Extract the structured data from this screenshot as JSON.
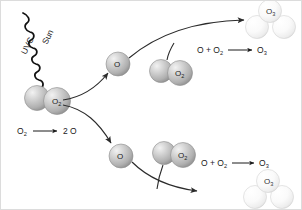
{
  "diagram": {
    "background_color": "#ffffff",
    "border_color": "#dcdcdc"
  },
  "radiation": {
    "source_label": "Sun",
    "type_label": "UVC",
    "icon": "wavy-ray-icon",
    "color": "#111111"
  },
  "equations": [
    {
      "id": "dissociation",
      "reactant": "O",
      "reactant_sub": "2",
      "arrow": "→",
      "product_count": "2",
      "product": "O",
      "full_text": "O2 → 2 O"
    },
    {
      "id": "recombination-upper",
      "left": "O + O",
      "left_sub": "2",
      "arrow": "→",
      "right": "O",
      "right_sub": "3",
      "full_text": "O + O2 → O3"
    },
    {
      "id": "recombination-lower",
      "left": "O + O",
      "left_sub": "2",
      "arrow": "→",
      "right": "O",
      "right_sub": "3",
      "full_text": "O + O2 → O3"
    }
  ],
  "molecules": [
    {
      "id": "source-o2",
      "label": "O",
      "subscript": "2",
      "species": "dioxygen",
      "atom_count": 2,
      "shade": "dark",
      "position": "origin-left"
    },
    {
      "id": "atomic-o-upper",
      "label": "O",
      "subscript": "",
      "species": "atomic-oxygen",
      "atom_count": 1,
      "shade": "dark",
      "position": "upper-middle-left"
    },
    {
      "id": "atomic-o-lower",
      "label": "O",
      "subscript": "",
      "species": "atomic-oxygen",
      "atom_count": 1,
      "shade": "dark",
      "position": "lower-middle-left"
    },
    {
      "id": "o2-upper",
      "label": "O",
      "subscript": "2",
      "species": "dioxygen",
      "atom_count": 2,
      "shade": "dark",
      "position": "upper-middle-right"
    },
    {
      "id": "o2-lower",
      "label": "O",
      "subscript": "2",
      "species": "dioxygen",
      "atom_count": 2,
      "shade": "dark",
      "position": "lower-middle-right"
    },
    {
      "id": "o3-upper",
      "label": "O",
      "subscript": "3",
      "species": "ozone",
      "atom_count": 3,
      "shade": "light",
      "position": "upper-right"
    },
    {
      "id": "o3-lower",
      "label": "O",
      "subscript": "3",
      "species": "ozone",
      "atom_count": 3,
      "shade": "light",
      "position": "lower-right"
    }
  ],
  "arrows": [
    {
      "id": "split-up",
      "from": "source-o2",
      "to": "atomic-o-upper"
    },
    {
      "id": "split-down",
      "from": "source-o2",
      "to": "atomic-o-lower"
    },
    {
      "id": "combine-up",
      "from": "atomic-o-upper",
      "to": "o3-upper"
    },
    {
      "id": "combine-o2-up",
      "from": "o2-upper",
      "to": "o3-upper"
    },
    {
      "id": "combine-down",
      "from": "atomic-o-lower",
      "to": "o3-lower"
    },
    {
      "id": "combine-o2-down",
      "from": "o2-lower",
      "to": "o3-lower"
    }
  ],
  "colors": {
    "sphere_dark_highlight": "#e9e9e9",
    "sphere_dark_mid": "#b9b9b9",
    "sphere_dark_edge": "#8a8a8a",
    "sphere_light_highlight": "#ffffff",
    "sphere_light_mid": "#f4f4f4",
    "sphere_light_edge": "#cfcfcf",
    "arrow_stroke": "#2b2b2b",
    "text": "#1a1a1a"
  }
}
